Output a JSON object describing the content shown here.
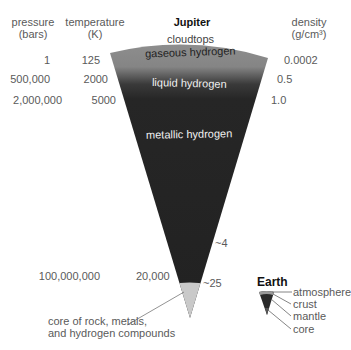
{
  "title": "Jupiter",
  "columns": {
    "pressure_header": [
      "pressure",
      "(bars)"
    ],
    "temperature_header": [
      "temperature",
      "(K)"
    ],
    "density_header": [
      "density",
      "(g/cm³)"
    ]
  },
  "rows": [
    {
      "pressure": "1",
      "temperature": "125",
      "density": "0.0002"
    },
    {
      "pressure": "500,000",
      "temperature": "2000",
      "density": "0.5"
    },
    {
      "pressure": "2,000,000",
      "temperature": "5000",
      "density": "1.0"
    }
  ],
  "deep_density": "~4",
  "core_row": {
    "pressure": "100,000,000",
    "temperature": "20,000",
    "density": "~25"
  },
  "layers": {
    "cloudtops": "cloudtops",
    "gaseous": "gaseous hydrogen",
    "liquid": "liquid hydrogen",
    "metallic": "metallic hydrogen",
    "core": [
      "core of rock, metals,",
      "and hydrogen compounds"
    ]
  },
  "earth": {
    "title": "Earth",
    "labels": [
      "atmosphere",
      "crust",
      "mantle",
      "core"
    ]
  },
  "colors": {
    "gaseous": "#8a8a8a",
    "liquid": "#2a2a2a",
    "metallic": "#222222",
    "core": "#c8c8c8"
  }
}
